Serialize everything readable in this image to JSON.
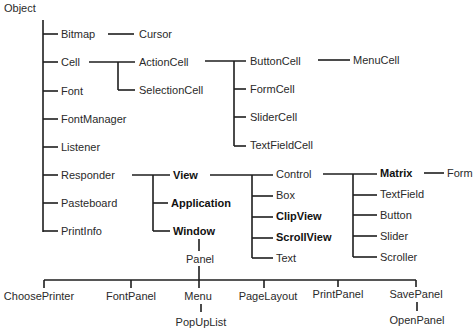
{
  "diagram": {
    "root": "Object",
    "nodes": [
      {
        "id": "object",
        "label": "Object",
        "x": 4,
        "y": 8,
        "bold": false
      },
      {
        "id": "bitmap",
        "label": "Bitmap",
        "x": 61,
        "y": 34,
        "bold": false
      },
      {
        "id": "cursor",
        "label": "Cursor",
        "x": 139,
        "y": 34,
        "bold": false
      },
      {
        "id": "cell",
        "label": "Cell",
        "x": 61,
        "y": 62,
        "bold": false
      },
      {
        "id": "actioncell",
        "label": "ActionCell",
        "x": 139,
        "y": 62,
        "bold": false
      },
      {
        "id": "selectioncell",
        "label": "SelectionCell",
        "x": 139,
        "y": 90,
        "bold": false
      },
      {
        "id": "buttoncell",
        "label": "ButtonCell",
        "x": 250,
        "y": 61,
        "bold": false
      },
      {
        "id": "menucell",
        "label": "MenuCell",
        "x": 353,
        "y": 60,
        "bold": false
      },
      {
        "id": "formcell",
        "label": "FormCell",
        "x": 250,
        "y": 89,
        "bold": false
      },
      {
        "id": "slidercell",
        "label": "SliderCell",
        "x": 250,
        "y": 117,
        "bold": false
      },
      {
        "id": "textfieldcell",
        "label": "TextFieldCell",
        "x": 250,
        "y": 145,
        "bold": false
      },
      {
        "id": "font",
        "label": "Font",
        "x": 61,
        "y": 91,
        "bold": false
      },
      {
        "id": "fontmanager",
        "label": "FontManager",
        "x": 61,
        "y": 119,
        "bold": false
      },
      {
        "id": "listener",
        "label": "Listener",
        "x": 61,
        "y": 147,
        "bold": false
      },
      {
        "id": "responder",
        "label": "Responder",
        "x": 61,
        "y": 175,
        "bold": false
      },
      {
        "id": "pasteboard",
        "label": "Pasteboard",
        "x": 61,
        "y": 203,
        "bold": false
      },
      {
        "id": "printinfo",
        "label": "PrintInfo",
        "x": 61,
        "y": 231,
        "bold": false
      },
      {
        "id": "view",
        "label": "View",
        "x": 173,
        "y": 175,
        "bold": true
      },
      {
        "id": "application",
        "label": "Application",
        "x": 171,
        "y": 203,
        "bold": true
      },
      {
        "id": "window",
        "label": "Window",
        "x": 173,
        "y": 231,
        "bold": true
      },
      {
        "id": "control",
        "label": "Control",
        "x": 276,
        "y": 174,
        "bold": false
      },
      {
        "id": "box",
        "label": "Box",
        "x": 276,
        "y": 195,
        "bold": false
      },
      {
        "id": "clipview",
        "label": "ClipView",
        "x": 276,
        "y": 216,
        "bold": true
      },
      {
        "id": "scrollview",
        "label": "ScrollView",
        "x": 276,
        "y": 237,
        "bold": true
      },
      {
        "id": "text",
        "label": "Text",
        "x": 276,
        "y": 258,
        "bold": false
      },
      {
        "id": "matrix",
        "label": "Matrix",
        "x": 380,
        "y": 173,
        "bold": true
      },
      {
        "id": "form",
        "label": "Form",
        "x": 447,
        "y": 173,
        "bold": false
      },
      {
        "id": "textfield",
        "label": "TextField",
        "x": 380,
        "y": 194,
        "bold": false
      },
      {
        "id": "button",
        "label": "Button",
        "x": 380,
        "y": 215,
        "bold": false
      },
      {
        "id": "slider",
        "label": "Slider",
        "x": 380,
        "y": 236,
        "bold": false
      },
      {
        "id": "scroller",
        "label": "Scroller",
        "x": 380,
        "y": 257,
        "bold": false
      },
      {
        "id": "panel",
        "label": "Panel",
        "x": 200,
        "y": 259,
        "bold": false,
        "center": true
      },
      {
        "id": "chooseprinter",
        "label": "ChoosePrinter",
        "x": 39,
        "y": 296,
        "bold": false,
        "center": true
      },
      {
        "id": "fontpanel",
        "label": "FontPanel",
        "x": 131,
        "y": 296,
        "bold": false,
        "center": true
      },
      {
        "id": "menu",
        "label": "Menu",
        "x": 198,
        "y": 296,
        "bold": false,
        "center": true
      },
      {
        "id": "popuplist",
        "label": "PopUpList",
        "x": 201,
        "y": 322,
        "bold": false,
        "center": true
      },
      {
        "id": "pagelayout",
        "label": "PageLayout",
        "x": 268,
        "y": 296,
        "bold": false,
        "center": true
      },
      {
        "id": "printpanel",
        "label": "PrintPanel",
        "x": 338,
        "y": 294,
        "bold": false,
        "center": true
      },
      {
        "id": "savepanel",
        "label": "SavePanel",
        "x": 416,
        "y": 294,
        "bold": false,
        "center": true
      },
      {
        "id": "openpanel",
        "label": "OpenPanel",
        "x": 417,
        "y": 320,
        "bold": false,
        "center": true
      }
    ],
    "lines": [
      [
        43,
        20,
        43,
        232
      ],
      [
        43,
        34,
        58,
        34
      ],
      [
        43,
        62,
        58,
        62
      ],
      [
        43,
        91,
        58,
        91
      ],
      [
        43,
        119,
        58,
        119
      ],
      [
        43,
        147,
        58,
        147
      ],
      [
        43,
        175,
        58,
        175
      ],
      [
        43,
        203,
        58,
        203
      ],
      [
        43,
        231,
        58,
        231
      ],
      [
        108,
        34,
        134,
        34
      ],
      [
        89,
        62,
        135,
        62
      ],
      [
        118,
        62,
        118,
        90
      ],
      [
        118,
        90,
        135,
        90
      ],
      [
        205,
        61,
        246,
        61
      ],
      [
        234,
        61,
        234,
        146
      ],
      [
        234,
        89,
        246,
        89
      ],
      [
        234,
        117,
        246,
        117
      ],
      [
        234,
        146,
        246,
        146
      ],
      [
        318,
        60,
        350,
        60
      ],
      [
        132,
        175,
        170,
        175
      ],
      [
        153,
        175,
        153,
        231
      ],
      [
        153,
        203,
        168,
        203
      ],
      [
        153,
        231,
        170,
        231
      ],
      [
        210,
        175,
        273,
        175
      ],
      [
        252,
        175,
        252,
        258
      ],
      [
        252,
        196,
        273,
        196
      ],
      [
        252,
        217,
        273,
        217
      ],
      [
        252,
        238,
        273,
        238
      ],
      [
        252,
        258,
        273,
        258
      ],
      [
        323,
        174,
        377,
        174
      ],
      [
        353,
        174,
        353,
        257
      ],
      [
        353,
        195,
        377,
        195
      ],
      [
        353,
        215,
        377,
        215
      ],
      [
        353,
        236,
        377,
        236
      ],
      [
        353,
        257,
        377,
        257
      ],
      [
        424,
        173,
        444,
        173
      ],
      [
        199,
        239,
        199,
        251
      ],
      [
        199,
        266,
        199,
        280
      ],
      [
        44,
        280,
        416,
        280
      ],
      [
        44,
        280,
        44,
        288
      ],
      [
        131,
        280,
        131,
        288
      ],
      [
        199,
        280,
        199,
        288
      ],
      [
        264,
        280,
        264,
        288
      ],
      [
        338,
        280,
        338,
        287
      ],
      [
        416,
        280,
        416,
        287
      ],
      [
        201,
        304,
        201,
        312
      ],
      [
        417,
        302,
        417,
        311
      ]
    ],
    "line_color": "#1e1e1e",
    "text_color": "#2a2a2a"
  }
}
